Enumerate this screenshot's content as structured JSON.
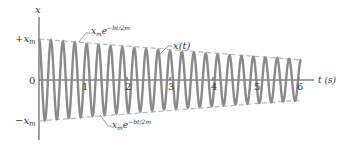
{
  "chart_data": {
    "type": "line",
    "title": "",
    "xlabel": "t (s)",
    "ylabel": "x",
    "x_ticks": [
      "1",
      "2",
      "3",
      "4",
      "5",
      "6"
    ],
    "y_ticks": [
      "+x_m",
      "0",
      "-x_m"
    ],
    "xlim": [
      0,
      6.2
    ],
    "ylim": [
      -1,
      1
    ],
    "series": [
      {
        "name": "x(t)",
        "description": "damped cosine oscillation",
        "amplitude_start": 1.0,
        "amplitude_end": 0.5,
        "cycles": 22,
        "period_s": 0.27
      },
      {
        "name": "x_m e^{-bt/2m}",
        "description": "upper envelope (dashed)"
      },
      {
        "name": "-x_m e^{-bt/2m}",
        "description": "lower envelope (dashed)"
      }
    ],
    "annotations": [
      "x_m e^{-bt/2m}",
      "x(t)",
      "x_m e^{-bt/2m}"
    ]
  },
  "axes": {
    "y_label": "x",
    "x_label": "t (s)",
    "plus_xm": "+x",
    "minus_xm": "−x",
    "sub_m": "m",
    "zero": "0",
    "ticks": [
      "1",
      "2",
      "3",
      "4",
      "5",
      "6"
    ]
  },
  "labels": {
    "envelope_top_base": "x",
    "envelope_top_sub": "m",
    "envelope_top_e": "e",
    "envelope_top_exp": "−bt/2m",
    "curve": "x(t)",
    "envelope_bottom_base": "x",
    "envelope_bottom_sub": "m",
    "envelope_bottom_e": "e",
    "envelope_bottom_exp": "−bt/2m"
  },
  "colors": {
    "curve": "#8a8a8a",
    "envelope": "#b5b5b5",
    "axis": "#444444"
  }
}
